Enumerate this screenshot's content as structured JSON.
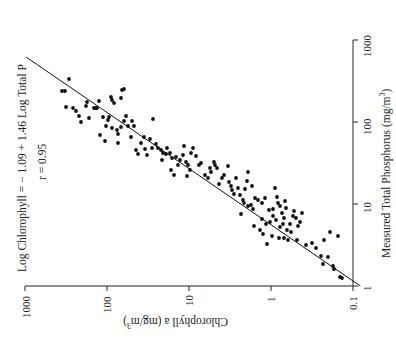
{
  "chart_data": {
    "type": "scatter",
    "title": "",
    "orientation_note": "figure rendered rotated 90 degrees counter-clockwise",
    "xlabel": "Measured Total Phosphorus (mg/m3)",
    "ylabel": "Chlorophyll a (mg/m3)",
    "xlabel_text": "Measured Total Phosphorus (mg/m",
    "ylabel_text": "Chlorophyll a (mg/m",
    "unit_superscript": "3",
    "xscale": "log",
    "yscale": "log",
    "xlim": [
      1,
      1000
    ],
    "ylim": [
      0.1,
      1000
    ],
    "x_ticks": [
      "1",
      "10",
      "100",
      "1000"
    ],
    "y_ticks": [
      "0.1",
      "1",
      "10",
      "100",
      "1000"
    ],
    "grid": false,
    "legend": null,
    "annotations": {
      "equation": "Log Chlorophyll  =  − 1.09  +  1.46 Log Total P",
      "r": "r  =  0.95"
    },
    "regression": {
      "intercept": -1.09,
      "slope": 1.46,
      "x_range": [
        1,
        620
      ]
    },
    "screen_points": [
      [
        69,
        79
      ],
      [
        62,
        91
      ],
      [
        65,
        91
      ],
      [
        66,
        107
      ],
      [
        73,
        108
      ],
      [
        76,
        111
      ],
      [
        79,
        116
      ],
      [
        81,
        122
      ],
      [
        87,
        102
      ],
      [
        89,
        118
      ],
      [
        99,
        101
      ],
      [
        97,
        108
      ],
      [
        86,
        106
      ],
      [
        111,
        97
      ],
      [
        112,
        100
      ],
      [
        114,
        103
      ],
      [
        122,
        90
      ],
      [
        121,
        98
      ],
      [
        124,
        89
      ],
      [
        96,
        108
      ],
      [
        94,
        108
      ],
      [
        100,
        135
      ],
      [
        105,
        141
      ],
      [
        106,
        126
      ],
      [
        108,
        120
      ],
      [
        109,
        117
      ],
      [
        103,
        117
      ],
      [
        112,
        128
      ],
      [
        117,
        130
      ],
      [
        118,
        134
      ],
      [
        118,
        143
      ],
      [
        121,
        127
      ],
      [
        124,
        121
      ],
      [
        126,
        116
      ],
      [
        128,
        126
      ],
      [
        132,
        121
      ],
      [
        131,
        137
      ],
      [
        134,
        126
      ],
      [
        136,
        150
      ],
      [
        138,
        154
      ],
      [
        141,
        143
      ],
      [
        144,
        137
      ],
      [
        145,
        149
      ],
      [
        147,
        155
      ],
      [
        150,
        139
      ],
      [
        152,
        148
      ],
      [
        153,
        119
      ],
      [
        156,
        144
      ],
      [
        158,
        148
      ],
      [
        161,
        150
      ],
      [
        162,
        160
      ],
      [
        163,
        153
      ],
      [
        166,
        154
      ],
      [
        167,
        148
      ],
      [
        170,
        153
      ],
      [
        172,
        158
      ],
      [
        176,
        157
      ],
      [
        171,
        170
      ],
      [
        174,
        175
      ],
      [
        178,
        165
      ],
      [
        180,
        160
      ],
      [
        183,
        155
      ],
      [
        184,
        146
      ],
      [
        186,
        162
      ],
      [
        188,
        165
      ],
      [
        191,
        153
      ],
      [
        193,
        148
      ],
      [
        187,
        176
      ],
      [
        190,
        170
      ],
      [
        196,
        156
      ],
      [
        199,
        165
      ],
      [
        201,
        163
      ],
      [
        205,
        175
      ],
      [
        208,
        178
      ],
      [
        210,
        168
      ],
      [
        211,
        172
      ],
      [
        214,
        162
      ],
      [
        215,
        165
      ],
      [
        217,
        168
      ],
      [
        219,
        184
      ],
      [
        222,
        178
      ],
      [
        224,
        175
      ],
      [
        228,
        166
      ],
      [
        229,
        182
      ],
      [
        231,
        186
      ],
      [
        232,
        190
      ],
      [
        234,
        194
      ],
      [
        236,
        178
      ],
      [
        238,
        188
      ],
      [
        240,
        195
      ],
      [
        243,
        200
      ],
      [
        245,
        189
      ],
      [
        247,
        181
      ],
      [
        248,
        172
      ],
      [
        252,
        186
      ],
      [
        255,
        198
      ],
      [
        241,
        214
      ],
      [
        244,
        203
      ],
      [
        248,
        206
      ],
      [
        251,
        205
      ],
      [
        253,
        209
      ],
      [
        258,
        200
      ],
      [
        262,
        203
      ],
      [
        265,
        198
      ],
      [
        269,
        210
      ],
      [
        273,
        209
      ],
      [
        275,
        188
      ],
      [
        277,
        197
      ],
      [
        278,
        203
      ],
      [
        280,
        206
      ],
      [
        282,
        213
      ],
      [
        285,
        201
      ],
      [
        286,
        208
      ],
      [
        262,
        219
      ],
      [
        266,
        224
      ],
      [
        270,
        222
      ],
      [
        273,
        216
      ],
      [
        276,
        220
      ],
      [
        280,
        227
      ],
      [
        283,
        224
      ],
      [
        284,
        218
      ],
      [
        287,
        230
      ],
      [
        290,
        224
      ],
      [
        293,
        216
      ],
      [
        294,
        211
      ],
      [
        296,
        218
      ],
      [
        298,
        226
      ],
      [
        300,
        222
      ],
      [
        302,
        213
      ],
      [
        272,
        236
      ],
      [
        279,
        238
      ],
      [
        284,
        238
      ],
      [
        288,
        240
      ],
      [
        254,
        226
      ],
      [
        260,
        230
      ],
      [
        263,
        234
      ],
      [
        267,
        244
      ],
      [
        291,
        232
      ],
      [
        297,
        240
      ],
      [
        306,
        245
      ],
      [
        312,
        243
      ],
      [
        316,
        248
      ],
      [
        321,
        256
      ],
      [
        328,
        257
      ],
      [
        323,
        264
      ],
      [
        333,
        266
      ],
      [
        334,
        269
      ],
      [
        340,
        277
      ],
      [
        342,
        278
      ],
      [
        324,
        240
      ],
      [
        330,
        232
      ],
      [
        338,
        236
      ]
    ]
  },
  "colors": {
    "ink": "#111111",
    "background": "#ffffff"
  }
}
